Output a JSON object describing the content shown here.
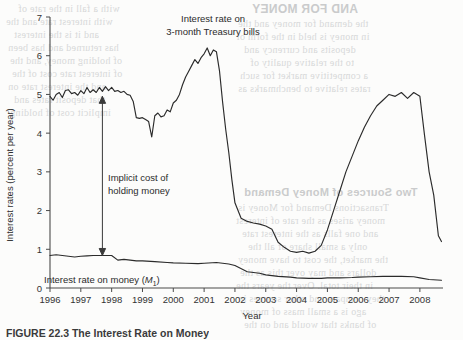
{
  "page": {
    "caption": "FIGURE 22.3  The Interest Rate on Money",
    "bleed_text": [
      {
        "text": "AND FOR MONEY",
        "x": 252,
        "y": 2,
        "size": 12,
        "bold": true,
        "mirrored": true
      },
      {
        "text": "the demand for money and the",
        "x": 238,
        "y": 18,
        "size": 10,
        "mirrored": true
      },
      {
        "text": "in money is held in the form of",
        "x": 236,
        "y": 31,
        "size": 10,
        "mirrored": true
      },
      {
        "text": "deposits and currency and",
        "x": 244,
        "y": 44,
        "size": 10,
        "mirrored": true
      },
      {
        "text": "to the relative quality of",
        "x": 250,
        "y": 57,
        "size": 10,
        "mirrored": true
      },
      {
        "text": "a competitive market for such",
        "x": 240,
        "y": 70,
        "size": 10,
        "mirrored": true
      },
      {
        "text": "rates relative to benchmarks as",
        "x": 238,
        "y": 83,
        "size": 10,
        "mirrored": true
      },
      {
        "text": "with a fall in the rate of",
        "x": 18,
        "y": 3,
        "size": 10,
        "mirrored": true
      },
      {
        "text": "with interest rate and the",
        "x": 6,
        "y": 16,
        "size": 10,
        "mirrored": true
      },
      {
        "text": "and it is the interest",
        "x": 14,
        "y": 29,
        "size": 10,
        "mirrored": true
      },
      {
        "text": "has returned and has been",
        "x": 8,
        "y": 42,
        "size": 10,
        "mirrored": true
      },
      {
        "text": "of holding money, and the",
        "x": 10,
        "y": 55,
        "size": 10,
        "mirrored": true
      },
      {
        "text": "of interest rate cost of the",
        "x": 12,
        "y": 68,
        "size": 10,
        "mirrored": true
      },
      {
        "text": "and the interest rate on",
        "x": 8,
        "y": 81,
        "size": 10,
        "mirrored": true
      },
      {
        "text": "that deposit rates and",
        "x": 14,
        "y": 94,
        "size": 10,
        "mirrored": true
      },
      {
        "text": "implicit cost of holding",
        "x": 10,
        "y": 107,
        "size": 10,
        "mirrored": true
      },
      {
        "text": "Two Sources of Money Demand",
        "x": 244,
        "y": 186,
        "size": 11,
        "bold": true,
        "mirrored": true
      },
      {
        "text": "Transactions Demand for Money is",
        "x": 238,
        "y": 202,
        "size": 10,
        "mirrored": true
      },
      {
        "text": "money arises as the rate of interest",
        "x": 236,
        "y": 215,
        "size": 10,
        "mirrored": true
      },
      {
        "text": "and one falls as the interest rate",
        "x": 242,
        "y": 228,
        "size": 10,
        "mirrored": true
      },
      {
        "text": "only a small share of all the",
        "x": 248,
        "y": 241,
        "size": 10,
        "mirrored": true
      },
      {
        "text": "the market, the cost to have money",
        "x": 238,
        "y": 254,
        "size": 10,
        "mirrored": true
      },
      {
        "text": "dollars and may over this as the",
        "x": 240,
        "y": 267,
        "size": 10,
        "mirrored": true
      },
      {
        "text": "in their total. Over the years the",
        "x": 236,
        "y": 280,
        "size": 10,
        "mirrored": true
      },
      {
        "text": "they compare and other sources in",
        "x": 238,
        "y": 293,
        "size": 10,
        "mirrored": true
      },
      {
        "text": "ago is a small mass of money",
        "x": 240,
        "y": 306,
        "size": 10,
        "mirrored": true
      },
      {
        "text": "of banks that would and on the",
        "x": 244,
        "y": 319,
        "size": 10,
        "mirrored": true
      }
    ]
  },
  "chart_data": {
    "type": "line",
    "title": "",
    "xlabel": "Year",
    "ylabel": "Interest rates (percent per year)",
    "xlim": [
      1996.0,
      2008.75
    ],
    "ylim": [
      0,
      7
    ],
    "xticks": [
      1996,
      1997,
      1998,
      1999,
      2000,
      2001,
      2002,
      2003,
      2004,
      2005,
      2006,
      2007,
      2008
    ],
    "xticklabels": [
      "1996",
      "1997",
      "1998",
      "1999",
      "2000",
      "2001",
      "2002",
      "2003",
      "2004",
      "2005",
      "2006",
      "2007",
      "2008"
    ],
    "yticks": [
      0,
      1,
      2,
      3,
      4,
      5,
      6,
      7
    ],
    "yticklabels": [
      "0",
      "1",
      "2",
      "3",
      "4",
      "5",
      "6",
      "7"
    ],
    "grid": false,
    "legend_position": "inline-annotations",
    "series": [
      {
        "name": "Interest rate on 3-month Treasury bills",
        "label_line1": "Interest rate on",
        "label_line2": "3-month Treasury bills",
        "color": "#2b2b2b",
        "x": [
          1996.0,
          1996.1,
          1996.2,
          1996.3,
          1996.4,
          1996.5,
          1996.6,
          1996.7,
          1996.8,
          1996.9,
          1997.0,
          1997.1,
          1997.2,
          1997.3,
          1997.4,
          1997.5,
          1997.6,
          1997.7,
          1997.8,
          1997.9,
          1998.0,
          1998.1,
          1998.2,
          1998.3,
          1998.4,
          1998.5,
          1998.6,
          1998.7,
          1998.8,
          1998.9,
          1999.0,
          1999.1,
          1999.2,
          1999.3,
          1999.4,
          1999.5,
          1999.6,
          1999.7,
          1999.8,
          1999.9,
          2000.0,
          2000.1,
          2000.2,
          2000.3,
          2000.4,
          2000.5,
          2000.6,
          2000.7,
          2000.8,
          2000.9,
          2001.0,
          2001.1,
          2001.2,
          2001.3,
          2001.4,
          2001.5,
          2001.6,
          2001.7,
          2001.8,
          2001.9,
          2002.0,
          2002.2,
          2002.4,
          2002.6,
          2002.8,
          2003.0,
          2003.2,
          2003.4,
          2003.6,
          2003.8,
          2004.0,
          2004.2,
          2004.4,
          2004.6,
          2004.8,
          2005.0,
          2005.2,
          2005.4,
          2005.6,
          2005.8,
          2006.0,
          2006.2,
          2006.4,
          2006.6,
          2006.8,
          2007.0,
          2007.2,
          2007.4,
          2007.6,
          2007.8,
          2008.0,
          2008.15,
          2008.3,
          2008.45,
          2008.6,
          2008.7
        ],
        "y": [
          4.95,
          4.85,
          5.0,
          5.05,
          4.92,
          5.1,
          5.12,
          5.02,
          5.05,
          4.98,
          5.1,
          5.02,
          5.18,
          5.05,
          5.12,
          5.05,
          5.18,
          5.08,
          5.2,
          5.1,
          5.18,
          5.08,
          5.1,
          5.05,
          5.08,
          5.0,
          4.98,
          4.82,
          4.4,
          4.38,
          4.4,
          4.35,
          4.3,
          3.9,
          4.45,
          4.52,
          4.42,
          4.45,
          4.6,
          4.55,
          4.78,
          4.85,
          5.0,
          5.25,
          5.45,
          5.6,
          5.75,
          5.9,
          5.8,
          5.95,
          6.05,
          6.2,
          6.0,
          6.15,
          6.1,
          5.6,
          4.8,
          4.1,
          3.5,
          2.8,
          2.2,
          1.8,
          1.72,
          1.68,
          1.65,
          1.6,
          1.52,
          1.18,
          1.05,
          0.95,
          0.92,
          0.95,
          0.9,
          0.95,
          1.1,
          1.5,
          2.0,
          2.5,
          3.0,
          3.4,
          3.8,
          4.15,
          4.45,
          4.7,
          4.85,
          5.0,
          4.95,
          5.05,
          4.9,
          5.05,
          4.95,
          3.95,
          3.0,
          2.4,
          1.35,
          1.2
        ]
      },
      {
        "name": "Interest rate on money (M1)",
        "label_main": "Interest rate on money (",
        "label_sub": "M",
        "label_sub_index": "1",
        "label_tail": ")",
        "color": "#2b2b2b",
        "x": [
          1996.0,
          1996.2,
          1996.4,
          1996.6,
          1996.8,
          1997.0,
          1997.2,
          1997.4,
          1997.6,
          1997.8,
          1998.0,
          1998.2,
          1998.4,
          1998.6,
          1998.8,
          1999.0,
          1999.4,
          1999.8,
          2000.0,
          2000.4,
          2000.8,
          2001.0,
          2001.4,
          2001.8,
          2002.0,
          2002.4,
          2002.8,
          2003.0,
          2003.4,
          2003.8,
          2004.0,
          2004.4,
          2004.8,
          2005.0,
          2005.4,
          2005.8,
          2006.0,
          2006.4,
          2006.8,
          2007.0,
          2007.4,
          2007.8,
          2008.0,
          2008.3,
          2008.7
        ],
        "y": [
          0.84,
          0.86,
          0.84,
          0.82,
          0.8,
          0.82,
          0.83,
          0.84,
          0.84,
          0.84,
          0.84,
          0.72,
          0.74,
          0.72,
          0.7,
          0.7,
          0.68,
          0.66,
          0.65,
          0.64,
          0.63,
          0.64,
          0.66,
          0.62,
          0.58,
          0.42,
          0.38,
          0.34,
          0.3,
          0.28,
          0.26,
          0.25,
          0.25,
          0.26,
          0.26,
          0.27,
          0.28,
          0.29,
          0.3,
          0.3,
          0.3,
          0.29,
          0.26,
          0.22,
          0.2
        ]
      }
    ],
    "annotations": [
      {
        "name": "implicit-cost-arrow",
        "line1": "Implicit cost of",
        "line2": "holding money",
        "x_year": 1997.7,
        "y_top": 4.95,
        "y_bottom": 0.84,
        "arrow": "double"
      }
    ]
  }
}
